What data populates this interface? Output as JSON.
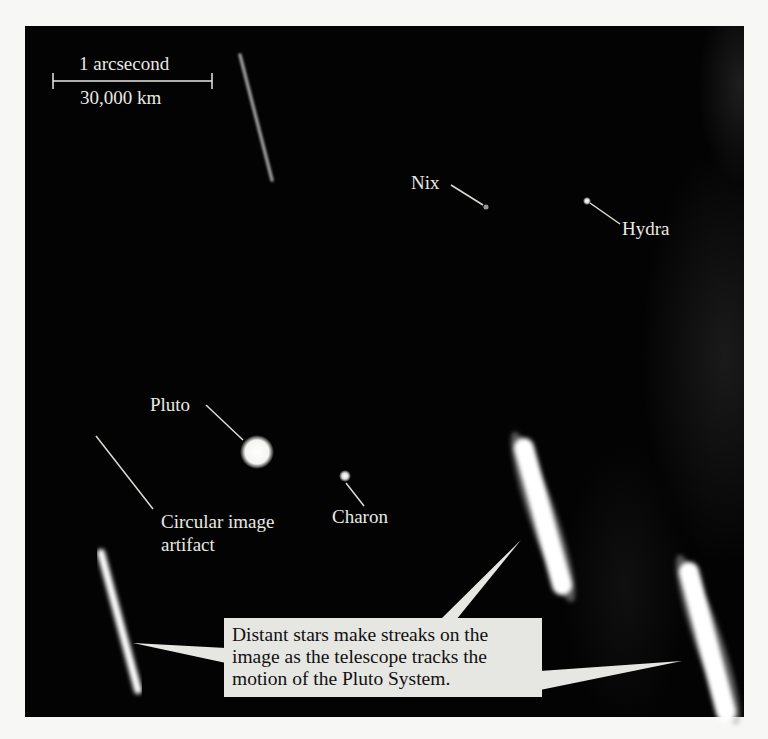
{
  "figure": {
    "background_color": "#030303",
    "page_color": "#f7f7f5",
    "scale_bar": {
      "top_label": "1 arcsecond",
      "bottom_label": "30,000 km"
    },
    "labels": {
      "nix": "Nix",
      "hydra": "Hydra",
      "pluto": "Pluto",
      "charon": "Charon",
      "artifact_line1": "Circular image",
      "artifact_line2": "artifact"
    },
    "callout": {
      "line1": "Distant stars make streaks on the",
      "line2": "image as the telescope tracks the",
      "line3": "motion of the Pluto System.",
      "background_color": "#e6e6e3"
    }
  }
}
